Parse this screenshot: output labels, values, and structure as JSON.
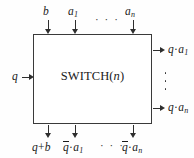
{
  "figure": {
    "block_label": {
      "name": "SWITCH",
      "open_paren": "(",
      "parameter": "n",
      "close_paren": ")"
    },
    "colors": {
      "background": "#fefefe",
      "box_fill": "#ffffff",
      "line": "#2e2e2e",
      "text": "#1b1b1b"
    },
    "top_inputs": [
      {
        "id": "b",
        "label_plain": "b",
        "var": "b",
        "sub": ""
      },
      {
        "id": "a1",
        "label_plain": "a1",
        "var": "a",
        "sub": "1"
      },
      {
        "id": "an",
        "label_plain": "an",
        "var": "a",
        "sub": "n"
      }
    ],
    "top_ellipsis": "· · ·",
    "left_inputs": [
      {
        "id": "q",
        "label_plain": "q",
        "var": "q"
      }
    ],
    "right_outputs": [
      {
        "id": "q_a1",
        "label_plain": "q·a1",
        "var": "q",
        "op": "·",
        "var2": "a",
        "sub": "1"
      },
      {
        "id": "q_an",
        "label_plain": "q·an",
        "var": "q",
        "op": "·",
        "var2": "a",
        "sub": "n"
      }
    ],
    "right_ellipsis": "vertical-dots",
    "bottom_outputs": [
      {
        "id": "q_plus_b",
        "label_plain": "q+b",
        "var": "q",
        "op": "+",
        "var2": "b",
        "sub": "",
        "overbar": false
      },
      {
        "id": "nq_a1",
        "label_plain": "q̄·a1",
        "var": "q",
        "op": "·",
        "var2": "a",
        "sub": "1",
        "overbar": true
      },
      {
        "id": "nq_an",
        "label_plain": "q̄·an",
        "var": "q",
        "op": "·",
        "var2": "a",
        "sub": "n",
        "overbar": true
      }
    ],
    "bottom_ellipsis": "· · ·"
  }
}
